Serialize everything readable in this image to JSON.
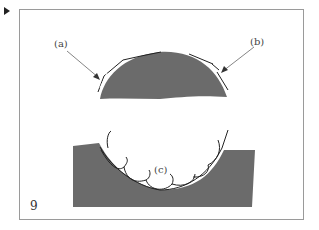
{
  "figure": {
    "number": "9",
    "labels": {
      "a": "(a)",
      "b": "(b)",
      "c": "(c)"
    },
    "colors": {
      "fill": "#6b6b6b",
      "frame": "#9a9a9a",
      "line": "#222222"
    }
  }
}
